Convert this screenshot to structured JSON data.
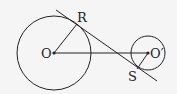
{
  "diagram": {
    "type": "geometry",
    "colors": {
      "stroke": "#222222",
      "background": "#f5f5f5"
    },
    "circles": [
      {
        "name": "large-circle",
        "center_label": "O",
        "cx": 54,
        "cy": 53,
        "r": 37
      },
      {
        "name": "small-circle",
        "center_label": "O'",
        "cx": 148,
        "cy": 53,
        "r": 17
      }
    ],
    "points": {
      "O": {
        "label": "O",
        "x": 54,
        "y": 53
      },
      "O_prime": {
        "label": "O′",
        "x": 148,
        "y": 53
      },
      "R": {
        "label": "R",
        "x": 77,
        "y": 24
      },
      "S": {
        "label": "S",
        "x": 137,
        "y": 69
      }
    },
    "segments": [
      {
        "name": "radius-OR",
        "from": "O",
        "to": "R"
      },
      {
        "name": "radius-OS",
        "from": "O_prime",
        "to": "S"
      },
      {
        "name": "center-line-OO",
        "from": "O",
        "to": "O_prime"
      }
    ],
    "tangent_line": {
      "name": "common-tangent",
      "x1": 56,
      "y1": 10,
      "x2": 157,
      "y2": 81
    },
    "labels": {
      "O": "O",
      "O_prime": "O′",
      "R": "R",
      "S": "S"
    }
  }
}
